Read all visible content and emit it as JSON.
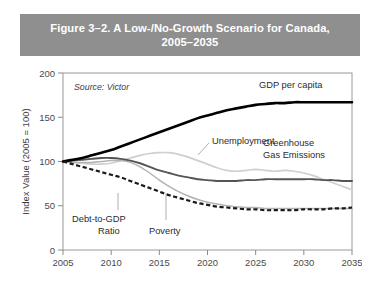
{
  "figure": {
    "title_line1": "Figure 3–2. A Low-/No-Growth Scenario for Canada,",
    "title_line2": "2005–2035",
    "banner_color": "#8f8f8f",
    "banner_text_color": "#ffffff"
  },
  "chart_data": {
    "type": "line",
    "title": "Figure 3–2. A Low-/No-Growth Scenario for Canada, 2005–2035",
    "subtitle": "",
    "source": "Source: Victor",
    "xlabel": "",
    "ylabel": "Index Value (2005 = 100)",
    "xlim": [
      2005,
      2035
    ],
    "ylim": [
      0,
      200
    ],
    "xticks": [
      2005,
      2010,
      2015,
      2020,
      2025,
      2030,
      2035
    ],
    "xticklabels": [
      "2005",
      "2010",
      "2015",
      "2020",
      "2025",
      "2030",
      "2035"
    ],
    "yticks": [
      0,
      50,
      100,
      150,
      200
    ],
    "yticklabels": [
      "0",
      "50",
      "100",
      "150",
      "200"
    ],
    "grid": false,
    "legend": "inline-annotations",
    "x": [
      2005,
      2006,
      2007,
      2008,
      2009,
      2010,
      2011,
      2012,
      2013,
      2014,
      2015,
      2016,
      2017,
      2018,
      2019,
      2020,
      2021,
      2022,
      2023,
      2024,
      2025,
      2026,
      2027,
      2028,
      2029,
      2030,
      2031,
      2032,
      2033,
      2034,
      2035
    ],
    "series": [
      {
        "name": "GDP per capita",
        "color": "#000000",
        "style": "solid-thick",
        "label_x": 2026,
        "label_y": 182,
        "values": [
          100,
          102,
          104,
          107,
          110,
          113,
          117,
          121,
          125,
          129,
          133,
          137,
          141,
          145,
          149,
          152,
          155,
          158,
          160,
          162,
          164,
          165,
          166,
          166,
          167,
          167,
          167,
          167,
          167,
          167,
          167
        ]
      },
      {
        "name": "Greenhouse Gas Emissions",
        "color": "#555555",
        "style": "solid-medium",
        "label_x": 2025,
        "label_y": 128,
        "values": [
          100,
          101,
          102,
          103,
          104,
          104,
          103,
          101,
          98,
          94,
          90,
          87,
          84,
          82,
          80,
          79,
          78,
          78,
          78,
          79,
          79,
          80,
          80,
          80,
          80,
          80,
          80,
          79,
          79,
          78,
          78
        ]
      },
      {
        "name": "Unemployment",
        "color": "#cfcfcf",
        "style": "solid-light",
        "label_x": 2019,
        "label_y": 124,
        "values": [
          100,
          99,
          98,
          97,
          97,
          98,
          101,
          104,
          107,
          109,
          110,
          110,
          108,
          105,
          101,
          97,
          93,
          90,
          89,
          90,
          91,
          90,
          89,
          90,
          89,
          87,
          84,
          80,
          76,
          72,
          68
        ]
      },
      {
        "name": "Poverty",
        "color": "#b3b3b3",
        "style": "solid-light",
        "label_x": 2016,
        "label_y": 35,
        "values": [
          100,
          99,
          99,
          99,
          100,
          101,
          101,
          99,
          94,
          87,
          79,
          72,
          66,
          61,
          57,
          54,
          52,
          50,
          49,
          48,
          48,
          47,
          47,
          47,
          47,
          47,
          47,
          47,
          47,
          47,
          47
        ]
      },
      {
        "name": "Debt-to-GDP Ratio",
        "color": "#1a1a1a",
        "style": "dashed",
        "label_x": 2011,
        "label_y": 48,
        "values": [
          100,
          97,
          94,
          91,
          88,
          85,
          82,
          78,
          74,
          70,
          66,
          62,
          59,
          56,
          53,
          51,
          49,
          48,
          47,
          46,
          46,
          45,
          45,
          45,
          45,
          46,
          46,
          46,
          47,
          47,
          48
        ]
      }
    ],
    "annotations": [
      {
        "text": "GDP per capita",
        "x": 2026,
        "y": 182
      },
      {
        "text": "Unemployment",
        "x": 2019,
        "y": 124
      },
      {
        "text": "Greenhouse",
        "x": 2026,
        "y": 122
      },
      {
        "text": "Gas Emissions",
        "x": 2026,
        "y": 110
      },
      {
        "text": "Debt-to-GDP",
        "x": 2010,
        "y": 48
      },
      {
        "text": "Ratio",
        "x": 2011,
        "y": 36
      },
      {
        "text": "Poverty",
        "x": 2016,
        "y": 30
      }
    ]
  }
}
